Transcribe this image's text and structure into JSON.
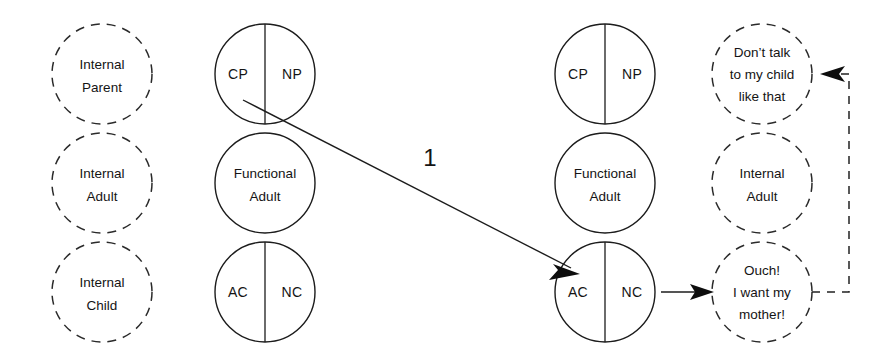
{
  "diagram": {
    "background_color": "#ffffff",
    "line_color": "#1c1c1c",
    "columns": [
      {
        "id": "internal-structure-left",
        "style": "dashed",
        "center_x": 102,
        "circles": [
          {
            "id": "internal-parent",
            "center_y": 74,
            "radius": 50,
            "split": false,
            "lines": [
              "Internal",
              "Parent"
            ]
          },
          {
            "id": "internal-adult",
            "center_y": 183,
            "radius": 50,
            "split": false,
            "lines": [
              "Internal",
              "Adult"
            ]
          },
          {
            "id": "internal-child",
            "center_y": 292,
            "radius": 50,
            "split": false,
            "lines": [
              "Internal",
              "Child"
            ]
          }
        ]
      },
      {
        "id": "functional-structure-left",
        "style": "solid",
        "center_x": 265,
        "circles": [
          {
            "id": "parent-cp-np",
            "center_y": 74,
            "radius": 50,
            "split": true,
            "left_label": "CP",
            "right_label": "NP",
            "lines": []
          },
          {
            "id": "functional-adult-left",
            "center_y": 183,
            "radius": 50,
            "split": false,
            "lines": [
              "Functional",
              "Adult"
            ]
          },
          {
            "id": "child-ac-nc-left",
            "center_y": 292,
            "radius": 50,
            "split": true,
            "left_label": "AC",
            "right_label": "NC",
            "lines": []
          }
        ]
      },
      {
        "id": "functional-structure-right",
        "style": "solid",
        "center_x": 605,
        "circles": [
          {
            "id": "parent-cp-np-right",
            "center_y": 74,
            "radius": 50,
            "split": true,
            "left_label": "CP",
            "right_label": "NP",
            "lines": []
          },
          {
            "id": "functional-adult-right",
            "center_y": 183,
            "radius": 50,
            "split": false,
            "lines": [
              "Functional",
              "Adult"
            ]
          },
          {
            "id": "child-ac-nc-right",
            "center_y": 292,
            "radius": 50,
            "split": true,
            "left_label": "AC",
            "right_label": "NC",
            "lines": []
          }
        ]
      },
      {
        "id": "internal-structure-right",
        "style": "dashed",
        "center_x": 762,
        "circles": [
          {
            "id": "internal-parent-response",
            "center_y": 74,
            "radius": 50,
            "split": false,
            "lines": [
              "Don’t talk",
              "to my child",
              "like that"
            ]
          },
          {
            "id": "internal-adult-right",
            "center_y": 183,
            "radius": 50,
            "split": false,
            "lines": [
              "Internal",
              "Adult"
            ]
          },
          {
            "id": "internal-child-response",
            "center_y": 292,
            "radius": 50,
            "split": false,
            "lines": [
              "Ouch!",
              "I want my",
              "mother!"
            ]
          }
        ]
      }
    ],
    "connectors": [
      {
        "id": "transaction-1",
        "label": "1",
        "label_x": 430,
        "label_y": 160,
        "style": "solid",
        "from": "parent-cp-np",
        "to": "child-ac-nc-right",
        "x1": 243,
        "y1": 100,
        "x2": 578,
        "y2": 272
      },
      {
        "id": "child-to-response",
        "label": "",
        "style": "solid",
        "from": "child-ac-nc-right",
        "to": "internal-child-response",
        "x1": 661,
        "y1": 292,
        "x2": 713,
        "y2": 292
      },
      {
        "id": "internal-feedback-loop",
        "label": "",
        "style": "dashed",
        "from": "internal-child-response",
        "to": "internal-parent-response",
        "path": "M 812 292 L 849 292 L 849 74 L 825 74"
      }
    ]
  }
}
